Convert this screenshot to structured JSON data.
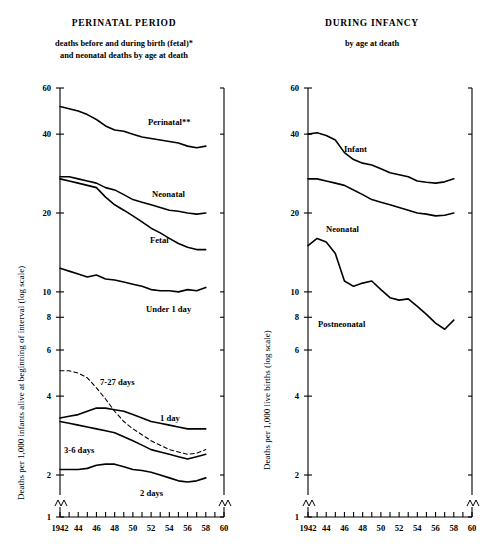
{
  "figure": {
    "panels": [
      {
        "id": "perinatal",
        "title": "PERINATAL PERIOD",
        "subtitle_line1": "deaths before and during birth (fetal)*",
        "subtitle_line2": "and neonatal deaths by age at death",
        "ylabel": "Deaths per 1,000 infants alive at beginning of interval (log scale)"
      },
      {
        "id": "infancy",
        "title": "DURING INFANCY",
        "subtitle_line1": "by age at death",
        "subtitle_line2": "",
        "ylabel": "Deaths per 1,000 live births (log scale)"
      }
    ],
    "yticks": [
      60,
      40,
      20,
      10,
      8,
      6,
      4,
      2,
      1
    ],
    "ytick_labels": [
      "60",
      "40",
      "20",
      "10",
      "8",
      "6",
      "4",
      "2",
      "1"
    ],
    "xticks": [
      1942,
      1943,
      1944,
      1945,
      1946,
      1947,
      1948,
      1949,
      1950,
      1951,
      1952,
      1953,
      1954,
      1955,
      1956,
      1957,
      1958,
      1959,
      1960
    ],
    "xtick_labels": [
      "1942",
      "44",
      "46",
      "48",
      "50",
      "52",
      "54",
      "56",
      "58",
      "60"
    ],
    "xtick_labeled_years": [
      1942,
      1944,
      1946,
      1948,
      1950,
      1952,
      1954,
      1956,
      1958,
      1960
    ],
    "axis_break": true,
    "line_color": "#000000"
  },
  "chart_data": [
    {
      "type": "line",
      "title": "PERINATAL PERIOD",
      "subtitle": "deaths before and during birth (fetal)* and neonatal deaths by age at death",
      "xlabel": "",
      "ylabel": "Deaths per 1,000 infants alive at beginning of interval (log scale)",
      "yscale": "log",
      "ylim": [
        1,
        60
      ],
      "xlim": [
        1942,
        1960
      ],
      "grid": false,
      "legend": "inline-labels",
      "x": [
        1942,
        1943,
        1944,
        1945,
        1946,
        1947,
        1948,
        1949,
        1950,
        1951,
        1952,
        1953,
        1954,
        1955,
        1956,
        1957,
        1958
      ],
      "series": [
        {
          "name": "Perinatal**",
          "label": "Perinatal**",
          "style": "solid",
          "values": [
            51.0,
            50.0,
            49.0,
            47.5,
            45.5,
            43.0,
            41.5,
            41.0,
            40.0,
            39.0,
            38.5,
            38.0,
            37.5,
            37.0,
            36.0,
            35.5,
            36.0
          ]
        },
        {
          "name": "Neonatal",
          "label": "Neonatal",
          "style": "solid",
          "values": [
            27.5,
            27.5,
            27.0,
            26.5,
            26.0,
            25.0,
            24.5,
            23.5,
            22.5,
            22.0,
            21.5,
            21.0,
            20.5,
            20.3,
            20.0,
            19.8,
            20.0
          ]
        },
        {
          "name": "Fetal",
          "label": "Fetal",
          "style": "solid",
          "values": [
            27.0,
            26.5,
            26.0,
            25.5,
            25.0,
            23.0,
            21.5,
            20.5,
            19.5,
            18.5,
            17.5,
            16.8,
            16.0,
            15.3,
            14.8,
            14.5,
            14.5
          ]
        },
        {
          "name": "Under 1 day",
          "label": "Under 1 day",
          "style": "solid",
          "values": [
            12.3,
            12.0,
            11.7,
            11.4,
            11.6,
            11.2,
            11.1,
            10.9,
            10.7,
            10.5,
            10.2,
            10.1,
            10.1,
            10.0,
            10.2,
            10.1,
            10.4
          ]
        },
        {
          "name": "7-27 days",
          "label": "7-27 days",
          "style": "dashed",
          "values": [
            5.0,
            5.0,
            4.9,
            4.7,
            4.3,
            3.9,
            3.5,
            3.2,
            3.0,
            2.85,
            2.7,
            2.6,
            2.5,
            2.45,
            2.4,
            2.42,
            2.5
          ]
        },
        {
          "name": "1 day",
          "label": "1 day",
          "style": "solid",
          "values": [
            3.3,
            3.35,
            3.4,
            3.5,
            3.6,
            3.6,
            3.55,
            3.5,
            3.4,
            3.3,
            3.2,
            3.15,
            3.1,
            3.05,
            3.0,
            3.0,
            3.0
          ]
        },
        {
          "name": "3-6 days",
          "label": "3-6 days",
          "style": "solid",
          "values": [
            3.2,
            3.15,
            3.1,
            3.05,
            3.0,
            2.95,
            2.9,
            2.8,
            2.7,
            2.6,
            2.5,
            2.45,
            2.4,
            2.35,
            2.3,
            2.35,
            2.4
          ]
        },
        {
          "name": "2 days",
          "label": "2 days",
          "style": "solid",
          "values": [
            2.1,
            2.1,
            2.1,
            2.12,
            2.18,
            2.2,
            2.2,
            2.15,
            2.1,
            2.08,
            2.05,
            2.0,
            1.95,
            1.9,
            1.88,
            1.9,
            1.95
          ]
        }
      ]
    },
    {
      "type": "line",
      "title": "DURING INFANCY",
      "subtitle": "by age at death",
      "xlabel": "",
      "ylabel": "Deaths per 1,000 live births (log scale)",
      "yscale": "log",
      "ylim": [
        1,
        60
      ],
      "xlim": [
        1942,
        1960
      ],
      "grid": false,
      "legend": "inline-labels",
      "x": [
        1942,
        1943,
        1944,
        1945,
        1946,
        1947,
        1948,
        1949,
        1950,
        1951,
        1952,
        1953,
        1954,
        1955,
        1956,
        1957,
        1958
      ],
      "series": [
        {
          "name": "Infant",
          "label": "Infant",
          "style": "solid",
          "values": [
            40.0,
            40.5,
            39.5,
            38.0,
            34.0,
            32.0,
            31.0,
            30.5,
            29.5,
            28.5,
            28.0,
            27.5,
            26.5,
            26.2,
            26.0,
            26.3,
            27.0
          ]
        },
        {
          "name": "Neonatal",
          "label": "Neonatal",
          "style": "solid",
          "values": [
            27.0,
            27.0,
            26.5,
            26.0,
            25.5,
            24.5,
            23.5,
            22.5,
            22.0,
            21.5,
            21.0,
            20.5,
            20.0,
            19.8,
            19.5,
            19.6,
            20.0
          ]
        },
        {
          "name": "Postneonatal",
          "label": "Postneonatal",
          "style": "solid",
          "values": [
            15.0,
            16.0,
            15.5,
            14.0,
            11.0,
            10.5,
            10.8,
            11.0,
            10.2,
            9.5,
            9.3,
            9.4,
            8.8,
            8.2,
            7.6,
            7.2,
            7.8
          ]
        }
      ]
    }
  ]
}
